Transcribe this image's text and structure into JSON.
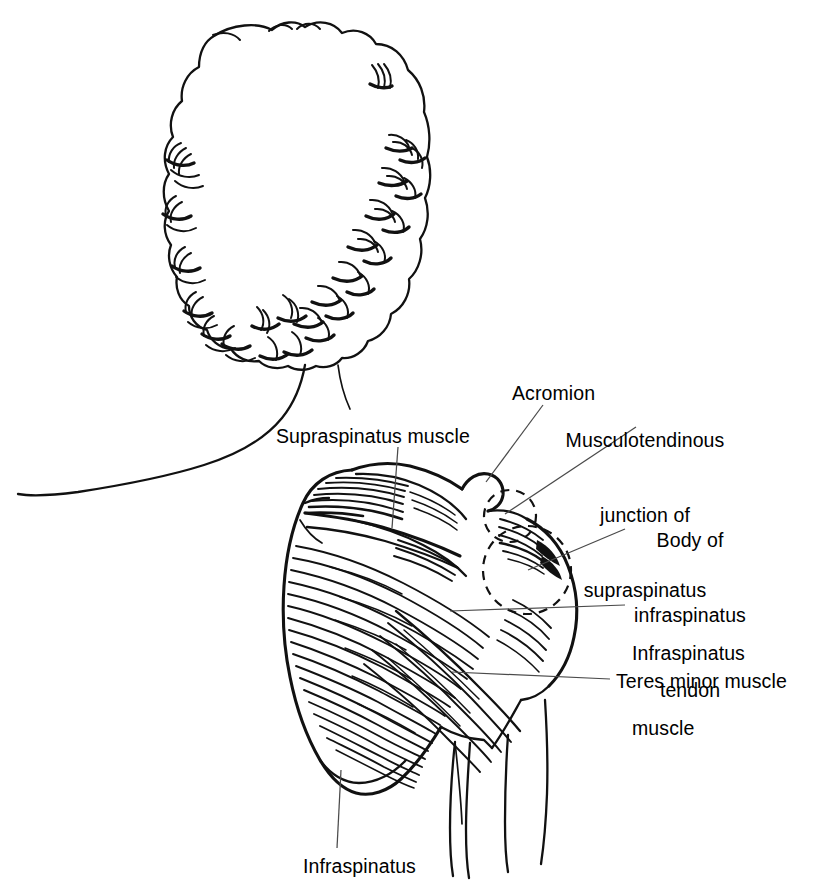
{
  "figure": {
    "view": "posterior",
    "style": "black-and-white line drawing",
    "background_color": "#ffffff",
    "ink_color": "#111111",
    "leader_color": "#4a4a4a"
  },
  "labels": {
    "supraspinatus_muscle": "Supraspinatus muscle",
    "acromion": "Acromion",
    "musculotendinous_junction": "Musculotendinous\njunction of\nsupraspinatus",
    "body_of_infraspinatus_tendon": "Body of\ninfraspinatus\ntendon",
    "infraspinatus_muscle": "Infraspinatus\nmuscle",
    "teres_minor_muscle": "Teres minor muscle",
    "infraspinatus_bottom": "Infraspinatus"
  },
  "label_lines": {
    "musculotendinous_junction": [
      "Musculotendinous",
      "junction of",
      "supraspinatus"
    ],
    "body_of_infraspinatus_tendon": [
      "Body of",
      "infraspinatus",
      "tendon"
    ],
    "infraspinatus_muscle": [
      "Infraspinatus",
      "muscle"
    ]
  },
  "annotations": [
    {
      "id": "supraspinatus-muscle",
      "text": "Supraspinatus muscle",
      "align": "left",
      "x": 276,
      "y": 424
    },
    {
      "id": "acromion",
      "text": "Acromion",
      "align": "left",
      "x": 512,
      "y": 381
    },
    {
      "id": "musculotendinous-junction",
      "text": "Musculotendinous junction of supraspinatus",
      "align": "center",
      "x": 645,
      "y": 378
    },
    {
      "id": "body-of-infraspinatus-tendon",
      "text": "Body of infraspinatus tendon",
      "align": "center",
      "x": 645,
      "y": 480
    },
    {
      "id": "infraspinatus-muscle",
      "text": "Infraspinatus muscle",
      "align": "left",
      "x": 632,
      "y": 591
    },
    {
      "id": "teres-minor-muscle",
      "text": "Teres minor muscle",
      "align": "left",
      "x": 616,
      "y": 671
    },
    {
      "id": "infraspinatus-bottom",
      "text": "Infraspinatus",
      "align": "left",
      "x": 303,
      "y": 856
    }
  ],
  "structures": [
    {
      "id": "head-hair",
      "name": "curly hair, back of head"
    },
    {
      "id": "neck",
      "name": "neck contour"
    },
    {
      "id": "left-shoulder",
      "name": "opposite shoulder contour"
    },
    {
      "id": "scapula",
      "name": "scapula outline"
    },
    {
      "id": "scapular-spine",
      "name": "spine of scapula"
    },
    {
      "id": "supraspinatus",
      "name": "supraspinatus muscle belly"
    },
    {
      "id": "infraspinatus",
      "name": "infraspinatus muscle belly"
    },
    {
      "id": "teres-minor",
      "name": "teres minor muscle band"
    },
    {
      "id": "acromion-process",
      "name": "acromion process"
    },
    {
      "id": "humerus-arm",
      "name": "upper arm / deltoid contour"
    },
    {
      "id": "tendon-circle-small",
      "name": "dashed circle: musculotendinous junction of supraspinatus"
    },
    {
      "id": "tendon-circle-large",
      "name": "dashed circle: body of infraspinatus tendon"
    }
  ]
}
